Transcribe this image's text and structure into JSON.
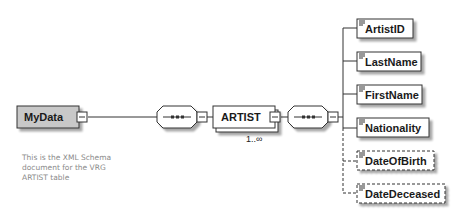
{
  "root": {
    "name": "MyData",
    "annotation": [
      "This is the XML Schema",
      "document for the VRG",
      "ARTIST table"
    ]
  },
  "sequence_1": {
    "type": "sequence",
    "symbol": "•••"
  },
  "artist": {
    "name": "ARTIST",
    "cardinality": "1..∞"
  },
  "sequence_2": {
    "type": "sequence",
    "symbol": "•••"
  },
  "children": [
    {
      "name": "ArtistID",
      "optional": false
    },
    {
      "name": "LastName",
      "optional": false
    },
    {
      "name": "FirstName",
      "optional": false
    },
    {
      "name": "Nationality",
      "optional": false
    },
    {
      "name": "DateOfBirth",
      "optional": true
    },
    {
      "name": "DateDeceased",
      "optional": true
    }
  ],
  "colors": {
    "root_fill": "#c8c8c8",
    "element_fill": "#ffffff",
    "border": "#333333",
    "shadow": "#bdbdbd",
    "note": "#8a8a8a"
  }
}
